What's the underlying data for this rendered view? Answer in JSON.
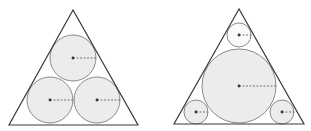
{
  "colors": {
    "stroke": "#3a3a3a",
    "circle_stroke": "#8a8a8a",
    "circle_fill": "#ececec",
    "light_fill": "#fafafa",
    "center": "#333333",
    "radius_line": "#555555"
  },
  "diagrams": [
    {
      "name": "three-equal-circles",
      "triangle": [
        [
          73,
          10
        ],
        [
          9,
          125
        ],
        [
          138,
          125
        ]
      ],
      "circles": [
        {
          "cx": 73,
          "cy": 58,
          "r": 23,
          "fill": "shaded"
        },
        {
          "cx": 50,
          "cy": 100,
          "r": 23,
          "fill": "shaded"
        },
        {
          "cx": 97,
          "cy": 100,
          "r": 23,
          "fill": "shaded"
        }
      ]
    },
    {
      "name": "incircle-with-three-corner-circles",
      "triangle": [
        [
          239,
          9
        ],
        [
          174,
          124
        ],
        [
          304,
          124
        ]
      ],
      "circles": [
        {
          "cx": 239,
          "cy": 35,
          "r": 12,
          "fill": "light"
        },
        {
          "cx": 239,
          "cy": 86,
          "r": 37,
          "fill": "shaded"
        },
        {
          "cx": 196,
          "cy": 112,
          "r": 12,
          "fill": "shaded"
        },
        {
          "cx": 282,
          "cy": 112,
          "r": 12,
          "fill": "shaded"
        }
      ]
    }
  ]
}
